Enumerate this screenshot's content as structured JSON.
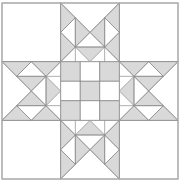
{
  "block": {
    "name": "quilt-block",
    "origin": [
      2,
      3
    ],
    "size": 176,
    "grid": 3,
    "colors": {
      "background": "#ffffff",
      "fill": "#d9d9d9",
      "line": "#8c8c8c",
      "border": "#b0b0b0"
    }
  },
  "center_nine_patch": {
    "cells": [
      [
        "grey",
        "white",
        "grey"
      ],
      [
        "white",
        "grey",
        "white"
      ],
      [
        "grey",
        "white",
        "grey"
      ]
    ]
  },
  "arm_unit": {
    "grey_triangles": [
      [
        [
          0,
          0
        ],
        [
          0.25,
          0.25
        ],
        [
          0,
          0.5
        ]
      ],
      [
        [
          1,
          0
        ],
        [
          0.75,
          0.25
        ],
        [
          1,
          0.5
        ]
      ],
      [
        [
          0.25,
          0.25
        ],
        [
          0.5,
          0.5
        ],
        [
          0.25,
          0.75
        ]
      ],
      [
        [
          0.75,
          0.25
        ],
        [
          0.5,
          0.5
        ],
        [
          0.75,
          0.75
        ]
      ],
      [
        [
          0,
          0.5
        ],
        [
          0.25,
          0.75
        ],
        [
          0,
          1
        ]
      ],
      [
        [
          1,
          0.5
        ],
        [
          0.75,
          0.75
        ],
        [
          1,
          1
        ]
      ],
      [
        [
          0.25,
          0.75
        ],
        [
          0.75,
          0.75
        ],
        [
          0.5,
          1
        ]
      ]
    ],
    "lines": [
      [
        [
          0,
          0
        ],
        [
          0.5,
          0.5
        ]
      ],
      [
        [
          1,
          0
        ],
        [
          0.5,
          0.5
        ]
      ],
      [
        [
          0,
          0.5
        ],
        [
          0.25,
          0.25
        ]
      ],
      [
        [
          1,
          0.5
        ],
        [
          0.75,
          0.25
        ]
      ],
      [
        [
          0.25,
          0.25
        ],
        [
          0.25,
          1
        ]
      ],
      [
        [
          0.75,
          0.25
        ],
        [
          0.75,
          1
        ]
      ],
      [
        [
          0,
          0.5
        ],
        [
          0.25,
          0.75
        ]
      ],
      [
        [
          1,
          0.5
        ],
        [
          0.75,
          0.75
        ]
      ],
      [
        [
          0.25,
          0.75
        ],
        [
          0.75,
          0.75
        ]
      ],
      [
        [
          0,
          1
        ],
        [
          0.5,
          0.5
        ]
      ],
      [
        [
          1,
          1
        ],
        [
          0.5,
          0.5
        ]
      ]
    ]
  },
  "arms": [
    {
      "name": "top-arm",
      "col": 1,
      "row": 0,
      "rotation": 0
    },
    {
      "name": "right-arm",
      "col": 2,
      "row": 1,
      "rotation": 90
    },
    {
      "name": "bottom-arm",
      "col": 1,
      "row": 2,
      "rotation": 180
    },
    {
      "name": "left-arm",
      "col": 0,
      "row": 1,
      "rotation": 270
    }
  ],
  "corners": [
    {
      "name": "corner-top-left",
      "col": 0,
      "row": 0
    },
    {
      "name": "corner-top-right",
      "col": 2,
      "row": 0
    },
    {
      "name": "corner-bottom-left",
      "col": 0,
      "row": 2
    },
    {
      "name": "corner-bottom-right",
      "col": 2,
      "row": 2
    }
  ]
}
